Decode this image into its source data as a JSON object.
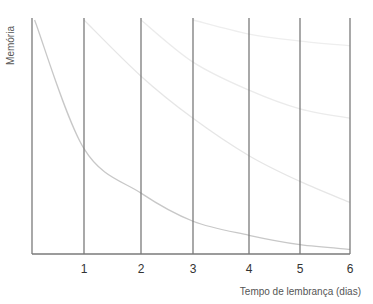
{
  "chart_data": {
    "type": "line",
    "title": "",
    "xlabel": "Tempo de lembrança (dias)",
    "ylabel": "Memória",
    "xlim": [
      0,
      6
    ],
    "ylim": [
      0,
      100
    ],
    "x_ticks": [
      "1",
      "2",
      "3",
      "4",
      "5",
      "6"
    ],
    "grid": "vertical lines at each day",
    "legend": null,
    "series": [
      {
        "name": "Curva 1 (início dia 0)",
        "x": [
          0.05,
          1,
          2,
          3,
          4,
          5,
          6
        ],
        "values": [
          100,
          45,
          26,
          14,
          8,
          4,
          2
        ]
      },
      {
        "name": "Curva 2 (revisão dia 1)",
        "x": [
          1,
          2,
          3,
          4,
          5,
          6
        ],
        "values": [
          100,
          76,
          58,
          42,
          31,
          22
        ]
      },
      {
        "name": "Curva 3 (revisão dia 2)",
        "x": [
          2,
          3,
          4,
          5,
          6
        ],
        "values": [
          100,
          82,
          70,
          62,
          58
        ]
      },
      {
        "name": "Curva 4 (revisão dia 3)",
        "x": [
          3,
          4,
          5,
          6
        ],
        "values": [
          100,
          94,
          91,
          89
        ]
      }
    ]
  },
  "axes": {
    "xlabel": "Tempo de lembrança (dias)",
    "ylabel": "Memória",
    "ticks": [
      "1",
      "2",
      "3",
      "4",
      "5",
      "6"
    ]
  },
  "colors": {
    "axis": "#7a7a7a",
    "curve_1": "#c8c8c8",
    "curve_2": "#e6e6e6",
    "curve_3": "#ebebeb",
    "curve_4": "#eeeeee",
    "text": "#444444"
  }
}
